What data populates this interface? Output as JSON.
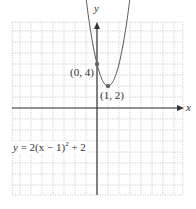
{
  "chart_data": {
    "type": "line",
    "title": "",
    "xlabel": "x",
    "ylabel": "y",
    "xlim": [
      -7.7,
      7.8
    ],
    "ylim": [
      -7.9,
      7.8
    ],
    "grid": true,
    "grid_style": "dotted",
    "series": [
      {
        "name": "y = 2(x − 1)² + 2",
        "equation": "y = 2(x - 1)^2 + 2",
        "x": [
          -1.2,
          -1,
          -0.5,
          0,
          0.5,
          1,
          1.5,
          2,
          2.5,
          3,
          3.2
        ],
        "y": [
          11.68,
          10,
          6.5,
          4,
          2.5,
          2,
          2.5,
          4,
          6.5,
          10,
          11.68
        ]
      }
    ],
    "points": [
      {
        "label": "(0, 4)",
        "x": 0,
        "y": 4
      },
      {
        "label": "(1, 2)",
        "x": 1,
        "y": 2
      }
    ],
    "annotations": [
      "y = 2(x − 1)² + 2"
    ]
  },
  "labels": {
    "x_axis": "x",
    "y_axis": "y",
    "point_a": "(0, 4)",
    "point_b": "(1, 2)",
    "equation_prefix": "y",
    "equation_body": " = 2(x − 1)",
    "equation_exp": "2",
    "equation_tail": " + 2"
  },
  "colors": {
    "grid": "#b5b5b5",
    "axis": "#333333",
    "curve": "#555555",
    "point": "#666666"
  }
}
